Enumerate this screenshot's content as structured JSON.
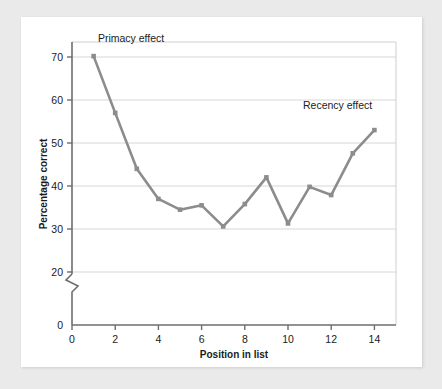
{
  "chart_data": {
    "type": "line",
    "title": "",
    "subtitle": "",
    "xlabel": "Position in list",
    "ylabel": "Percentage correct",
    "x": [
      1,
      2,
      3,
      4,
      5,
      6,
      7,
      8,
      9,
      10,
      11,
      12,
      13,
      14
    ],
    "values": [
      70.2,
      57.0,
      44.0,
      37.0,
      34.5,
      35.5,
      30.6,
      35.8,
      42.0,
      31.3,
      39.8,
      37.9,
      47.6,
      53.0
    ],
    "series": [
      {
        "name": "Percentage correct",
        "values": [
          70.2,
          57.0,
          44.0,
          37.0,
          34.5,
          35.5,
          30.6,
          35.8,
          42.0,
          31.3,
          39.8,
          37.9,
          47.6,
          53.0
        ]
      }
    ],
    "xlim": [
      0,
      15
    ],
    "ylim": [
      20,
      75
    ],
    "xticks": [
      "0",
      "2",
      "4",
      "6",
      "8",
      "10",
      "12",
      "14"
    ],
    "xtick_values": [
      0,
      2,
      4,
      6,
      8,
      10,
      12,
      14
    ],
    "yticks": [
      "0",
      "20",
      "30",
      "40",
      "50",
      "60",
      "70"
    ],
    "ytick_values": [
      0,
      20,
      30,
      40,
      50,
      60,
      70
    ],
    "grid": "horizontal",
    "axis_break": true,
    "axis_break_between": [
      0,
      20
    ],
    "legend": "none",
    "annotations": [
      {
        "text": "Primacy effect",
        "x": 1.2,
        "y": 73.5,
        "anchor": "start"
      },
      {
        "text": "Recency effect",
        "x": 13.9,
        "y": 58.0,
        "anchor": "end"
      }
    ],
    "line_color": "#8c8c8c",
    "marker_color": "#8c8c8c",
    "marker_shape": "square",
    "grid_color": "#d6d6d6",
    "axis_color": "#6e6e6e",
    "background": "#ffffff"
  },
  "page": {
    "background_color": "#eaeaea",
    "card_color": "#ffffff"
  }
}
